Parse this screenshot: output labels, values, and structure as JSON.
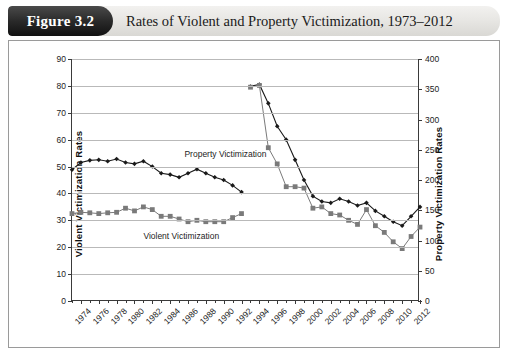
{
  "figure": {
    "badge": "Figure 3.2",
    "title": "Rates of Violent and Property Victimization, 1973–2012"
  },
  "chart_data": {
    "type": "line",
    "title": "Rates of Violent and Property Victimization, 1973–2012",
    "xlabel": "",
    "ylabel": "Violent Victimization Rates",
    "y2label": "Property Victimization Rates",
    "ylim": [
      0,
      90
    ],
    "y2lim": [
      0,
      400
    ],
    "yticks": [
      0,
      10,
      20,
      30,
      40,
      50,
      60,
      70,
      80,
      90
    ],
    "y2ticks": [
      0,
      50,
      100,
      150,
      200,
      250,
      300,
      350,
      400
    ],
    "xlim": [
      1973,
      2012
    ],
    "xticks": [
      1974,
      1976,
      1978,
      1980,
      1982,
      1984,
      1986,
      1988,
      1990,
      1992,
      1994,
      1996,
      1998,
      2000,
      2002,
      2004,
      2006,
      2008,
      2010,
      2012
    ],
    "grid": true,
    "legend_position": "inline-annotations",
    "annotations": [
      {
        "text": "Property Victimization",
        "x": 1985.6,
        "y": 56.5
      },
      {
        "text": "Violent Victimization",
        "x": 1981.0,
        "y": 26.0
      }
    ],
    "series": [
      {
        "name": "Property Victimization",
        "axis": "right",
        "marker": "diamond",
        "color": "#1a1a1a",
        "note": "values plotted against the left scale; right scale = value x 400/90",
        "segments": [
          {
            "label": "1973–1992 (old NCS design)",
            "x": [
              1973,
              1974,
              1975,
              1976,
              1977,
              1978,
              1979,
              1980,
              1981,
              1982,
              1983,
              1984,
              1985,
              1986,
              1987,
              1988,
              1989,
              1990,
              1991,
              1992
            ],
            "values": [
              48.8,
              51.5,
              52.3,
              52.5,
              52.0,
              52.8,
              51.5,
              51.0,
              52.0,
              50.0,
              47.5,
              47.0,
              46.0,
              47.5,
              49.0,
              47.5,
              46.0,
              45.0,
              43.0,
              40.5
            ]
          },
          {
            "label": "1993–2012 (redesigned NCVS)",
            "x": [
              1993,
              1994,
              1995,
              1996,
              1997,
              1998,
              1999,
              2000,
              2001,
              2002,
              2003,
              2004,
              2005,
              2006,
              2007,
              2008,
              2009,
              2010,
              2011,
              2012
            ],
            "values": [
              79.8,
              80.5,
              73.5,
              65.0,
              60.0,
              52.5,
              45.0,
              39.0,
              37.0,
              36.5,
              38.0,
              37.0,
              35.5,
              36.5,
              33.5,
              31.5,
              29.5,
              28.0,
              31.5,
              35.0
            ]
          }
        ]
      },
      {
        "name": "Violent Victimization",
        "axis": "left",
        "marker": "square",
        "color": "#7a7a7a",
        "segments": [
          {
            "label": "1973–1992 (old NCS design)",
            "x": [
              1973,
              1974,
              1975,
              1976,
              1977,
              1978,
              1979,
              1980,
              1981,
              1982,
              1983,
              1984,
              1985,
              1986,
              1987,
              1988,
              1989,
              1990,
              1991,
              1992
            ],
            "values": [
              32.5,
              33.0,
              32.8,
              32.5,
              32.8,
              33.0,
              34.5,
              33.5,
              35.0,
              34.0,
              31.5,
              31.5,
              30.5,
              29.5,
              30.0,
              29.5,
              29.5,
              29.5,
              31.0,
              32.5
            ]
          },
          {
            "label": "1993–2012 (redesigned NCVS)",
            "x": [
              1993,
              1994,
              1995,
              1996,
              1997,
              1998,
              1999,
              2000,
              2001,
              2002,
              2003,
              2004,
              2005,
              2006,
              2007,
              2008,
              2009,
              2010,
              2011,
              2012
            ],
            "values": [
              79.5,
              80.2,
              57.0,
              51.0,
              42.5,
              42.5,
              42.0,
              34.5,
              35.0,
              32.5,
              32.0,
              30.0,
              28.5,
              34.0,
              28.0,
              25.5,
              22.0,
              19.5,
              24.0,
              27.5
            ]
          }
        ]
      }
    ]
  }
}
